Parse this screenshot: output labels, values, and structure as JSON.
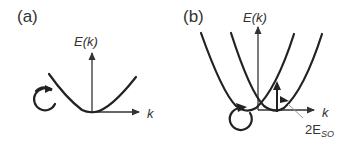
{
  "panels": [
    {
      "label": "(a)",
      "y_axis_label": "E(k)",
      "x_axis_label": "k"
    },
    {
      "label": "(b)",
      "y_axis_label": "E(k)",
      "x_axis_label": "k",
      "annotation": {
        "prefix": "2E",
        "subscript": "SO"
      }
    }
  ],
  "colors": {
    "curve": "#222222",
    "axis": "#333333",
    "leader": "#999999",
    "background": "#ffffff"
  }
}
